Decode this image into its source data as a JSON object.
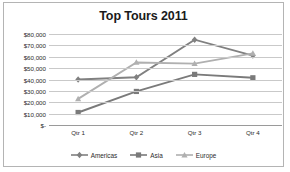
{
  "chart_data": {
    "type": "line",
    "title": "Top Tours 2011",
    "xlabel": "",
    "ylabel": "",
    "categories": [
      "Qtr 1",
      "Qtr 2",
      "Qtr 3",
      "Qtr 4"
    ],
    "ylim": [
      0,
      80000
    ],
    "ytick_values": [
      80000,
      70000,
      60000,
      50000,
      40000,
      30000,
      20000,
      10000,
      0
    ],
    "ytick_labels": [
      "$80,000",
      "$70,000",
      "$60,000",
      "$50,000",
      "$40,000",
      "$30,000",
      "$20,000",
      "$10,000",
      "$-"
    ],
    "grid": true,
    "legend_position": "bottom",
    "series": [
      {
        "name": "Americas",
        "marker": "diamond",
        "color": "#808080",
        "values": [
          40000,
          42000,
          75000,
          61000
        ]
      },
      {
        "name": "Asia",
        "marker": "square",
        "color": "#7a7a7a",
        "values": [
          11000,
          29500,
          44500,
          41500
        ]
      },
      {
        "name": "Europe",
        "marker": "triangle",
        "color": "#b0b0b0",
        "values": [
          23000,
          55000,
          54000,
          63000
        ]
      }
    ]
  },
  "legend": {
    "items": [
      {
        "label": "Americas"
      },
      {
        "label": "Asia"
      },
      {
        "label": "Europe"
      }
    ]
  },
  "colors": {
    "border": "#b4b4b4",
    "gridline": "#c9c9c9",
    "axis": "#9a9a9a",
    "text": "#2b2b2b",
    "title": "#1a1a1a"
  }
}
